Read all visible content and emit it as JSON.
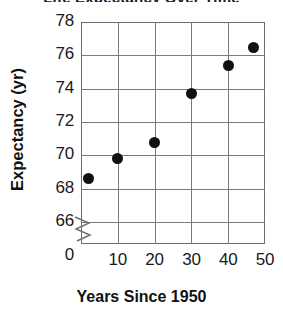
{
  "chart_data": {
    "type": "scatter",
    "title": "Life Expectancy Over Time",
    "xlabel": "Years Since 1950",
    "ylabel": "Expectancy (yr)",
    "xlim": [
      0,
      50
    ],
    "ylim": [
      65,
      78
    ],
    "y_axis_break": true,
    "y_axis_break_symbol": "zigzag",
    "grid": true,
    "legend": "none",
    "x_ticks": [
      "10",
      "20",
      "30",
      "40",
      "50"
    ],
    "x_tick_values": [
      10,
      20,
      30,
      40,
      50
    ],
    "y_ticks": [
      "66",
      "68",
      "70",
      "72",
      "74",
      "76",
      "78"
    ],
    "y_tick_values": [
      66,
      68,
      70,
      72,
      74,
      76,
      78
    ],
    "origin_label": "0",
    "marker": {
      "shape": "circle",
      "color": "#111111",
      "size": 11
    },
    "points": [
      {
        "x": 2,
        "y": 68.6
      },
      {
        "x": 10,
        "y": 69.8
      },
      {
        "x": 20,
        "y": 70.8
      },
      {
        "x": 30,
        "y": 73.7
      },
      {
        "x": 40,
        "y": 75.4
      },
      {
        "x": 47,
        "y": 76.5
      }
    ],
    "colors": {
      "marker": "#111111",
      "grid": "#7a7a7a",
      "frame": "#6e6e6e",
      "text": "#1a1a1a",
      "background": "#ffffff"
    }
  }
}
